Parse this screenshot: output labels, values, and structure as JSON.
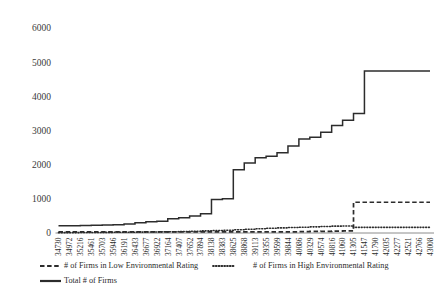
{
  "chart_data": {
    "type": "line",
    "title": "",
    "subtitle": "",
    "xlabel": "",
    "ylabel": "",
    "ylim": [
      0,
      6000
    ],
    "ytick_labels": [
      "0",
      "1000",
      "2000",
      "3000",
      "4000",
      "5000",
      "6000"
    ],
    "ytick_values": [
      0,
      1000,
      2000,
      3000,
      4000,
      5000,
      6000
    ],
    "grid": false,
    "legend_position": "bottom",
    "categories": [
      "34730",
      "34972",
      "35216",
      "35461",
      "35703",
      "35946",
      "36191",
      "36433",
      "36677",
      "36922",
      "37164",
      "37407",
      "37652",
      "37894",
      "38138",
      "38383",
      "38625",
      "38868",
      "39113",
      "39355",
      "39599",
      "39844",
      "40086",
      "40329",
      "40574",
      "40816",
      "41060",
      "41305",
      "41547",
      "41790",
      "42035",
      "42277",
      "42521",
      "42766",
      "43008"
    ],
    "series": [
      {
        "name": "# of Firms in Low Environmental Rating",
        "style": "dashed",
        "values": [
          30,
          30,
          30,
          30,
          30,
          30,
          30,
          30,
          30,
          30,
          30,
          30,
          30,
          30,
          30,
          30,
          30,
          30,
          30,
          30,
          30,
          35,
          40,
          45,
          50,
          55,
          60,
          900,
          900,
          900,
          900,
          900,
          900,
          900,
          900
        ]
      },
      {
        "name": "# of Firms in High Environmental Rating",
        "style": "dotted",
        "values": [
          10,
          12,
          14,
          16,
          18,
          20,
          22,
          26,
          30,
          34,
          38,
          44,
          52,
          62,
          72,
          82,
          95,
          110,
          125,
          140,
          150,
          160,
          170,
          180,
          190,
          200,
          205,
          165,
          165,
          165,
          165,
          165,
          165,
          165,
          165
        ]
      },
      {
        "name": "Total # of Firms",
        "style": "solid",
        "values": [
          210,
          215,
          220,
          225,
          235,
          245,
          260,
          300,
          330,
          345,
          420,
          450,
          500,
          560,
          980,
          1000,
          1850,
          2050,
          2200,
          2250,
          2350,
          2550,
          2750,
          2800,
          2950,
          3150,
          3300,
          3500,
          4740,
          4740,
          4740,
          4740,
          4740,
          4740,
          4740
        ]
      }
    ],
    "legend": [
      {
        "label": "# of Firms in Low Environmental Rating",
        "style": "dashed"
      },
      {
        "label": "# of Firms in High Environmental Rating",
        "style": "dotted"
      },
      {
        "label": "Total # of Firms",
        "style": "solid"
      }
    ],
    "colors": {
      "line": "#2c2c2c",
      "axis": "#6f6f6f",
      "text": "#2b2b2b",
      "background": "#ffffff"
    }
  }
}
